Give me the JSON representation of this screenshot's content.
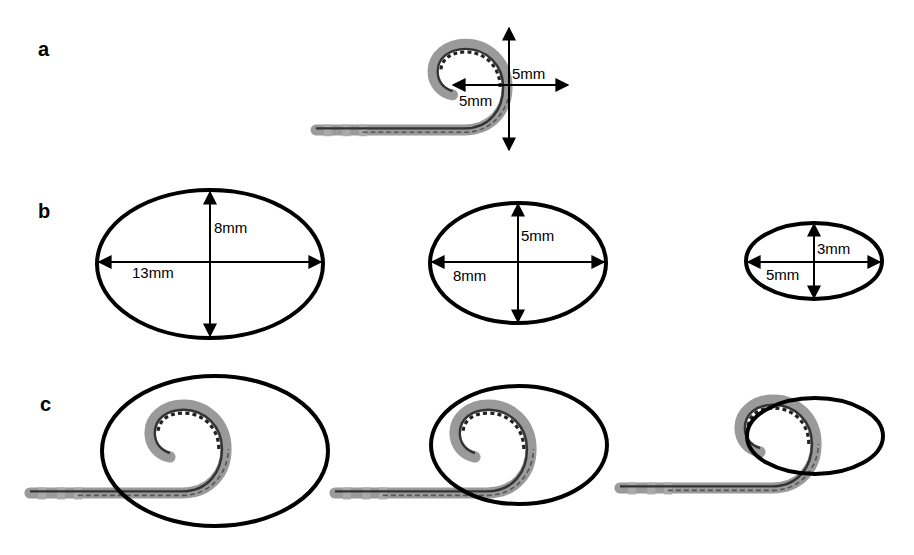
{
  "figure": {
    "panels": [
      {
        "label": "a",
        "description": "coiled catheter tip with diameter measurements",
        "dimensions": {
          "vertical": "5mm",
          "horizontal": "5mm"
        }
      },
      {
        "label": "b",
        "description": "target ellipses",
        "ellipses": [
          {
            "vertical": "8mm",
            "horizontal": "13mm"
          },
          {
            "vertical": "5mm",
            "horizontal": "8mm"
          },
          {
            "vertical": "3mm",
            "horizontal": "5mm"
          }
        ]
      },
      {
        "label": "c",
        "description": "catheter coil overlaid on ellipses",
        "overlays": [
          {
            "ellipse": "13mm x 8mm"
          },
          {
            "ellipse": "8mm x 5mm"
          },
          {
            "ellipse": "5mm x 3mm"
          }
        ]
      }
    ],
    "colors": {
      "line": "#000000",
      "catheter_body": "#9a9a9a",
      "catheter_core": "#3a3a3a",
      "background": "#ffffff"
    }
  }
}
